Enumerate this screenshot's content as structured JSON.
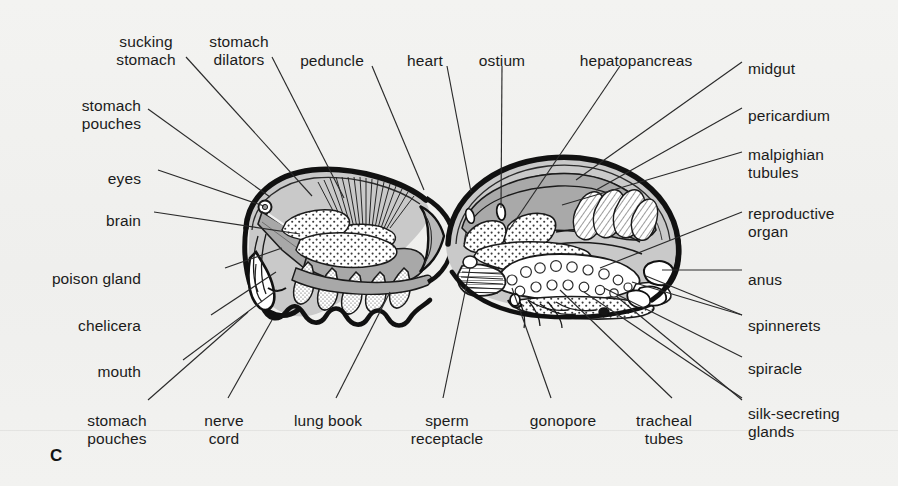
{
  "figure": {
    "letter": "C",
    "caption_type": "anatomical-cross-section",
    "background_color": "#f1f1ef",
    "ink_color": "#1b1b1b"
  },
  "labels_top": [
    {
      "name": "sucking-stomach",
      "text": "sucking\nstomach",
      "x": 146,
      "y": 33,
      "align": "center"
    },
    {
      "name": "stomach-dilators",
      "text": "stomach\ndilators",
      "x": 239,
      "y": 33,
      "align": "center"
    },
    {
      "name": "peduncle",
      "text": "peduncle",
      "x": 332,
      "y": 52,
      "align": "center"
    },
    {
      "name": "heart",
      "text": "heart",
      "x": 425,
      "y": 52,
      "align": "center"
    },
    {
      "name": "ostium",
      "text": "ostium",
      "x": 502,
      "y": 52,
      "align": "center"
    },
    {
      "name": "hepatopancreas",
      "text": "hepatopancreas",
      "x": 636,
      "y": 52,
      "align": "center"
    }
  ],
  "labels_left": [
    {
      "name": "stomach-pouches-upper",
      "text": "stomach\npouches",
      "x": 141,
      "y": 97,
      "align": "right"
    },
    {
      "name": "eyes",
      "text": "eyes",
      "x": 141,
      "y": 170,
      "align": "right"
    },
    {
      "name": "brain",
      "text": "brain",
      "x": 141,
      "y": 212,
      "align": "right"
    },
    {
      "name": "poison-gland",
      "text": "poison gland",
      "x": 141,
      "y": 270,
      "align": "right"
    },
    {
      "name": "chelicera",
      "text": "chelicera",
      "x": 141,
      "y": 317,
      "align": "right"
    },
    {
      "name": "mouth",
      "text": "mouth",
      "x": 141,
      "y": 363,
      "align": "right"
    }
  ],
  "labels_right": [
    {
      "name": "midgut",
      "text": "midgut",
      "x": 748,
      "y": 60,
      "align": "left"
    },
    {
      "name": "pericardium",
      "text": "pericardium",
      "x": 748,
      "y": 107,
      "align": "left"
    },
    {
      "name": "malpighian-tubules",
      "text": "malpighian\ntubules",
      "x": 748,
      "y": 146,
      "align": "left"
    },
    {
      "name": "reproductive-organ",
      "text": "reproductive\norgan",
      "x": 748,
      "y": 205,
      "align": "left"
    },
    {
      "name": "anus",
      "text": "anus",
      "x": 748,
      "y": 271,
      "align": "left"
    },
    {
      "name": "spinnerets",
      "text": "spinnerets",
      "x": 748,
      "y": 317,
      "align": "left"
    },
    {
      "name": "spiracle",
      "text": "spiracle",
      "x": 748,
      "y": 360,
      "align": "left"
    },
    {
      "name": "silk-secreting-glands",
      "text": "silk-secreting\nglands",
      "x": 748,
      "y": 405,
      "align": "left"
    }
  ],
  "labels_bottom": [
    {
      "name": "stomach-pouches-lower",
      "text": "stomach\npouches",
      "x": 117,
      "y": 412,
      "align": "center"
    },
    {
      "name": "nerve-cord",
      "text": "nerve\ncord",
      "x": 224,
      "y": 412,
      "align": "center"
    },
    {
      "name": "lung-book",
      "text": "lung book",
      "x": 328,
      "y": 412,
      "align": "center"
    },
    {
      "name": "sperm-receptacle",
      "text": "sperm\nreceptacle",
      "x": 447,
      "y": 412,
      "align": "center"
    },
    {
      "name": "gonopore",
      "text": "gonopore",
      "x": 563,
      "y": 412,
      "align": "center"
    },
    {
      "name": "tracheal-tubes",
      "text": "tracheal\ntubes",
      "x": 664,
      "y": 412,
      "align": "center"
    }
  ],
  "leader_lines": [
    {
      "name": "leader-sucking-stomach",
      "points": "186,57 312,196"
    },
    {
      "name": "leader-stomach-dilators",
      "points": "272,57 344,198"
    },
    {
      "name": "leader-peduncle",
      "points": "372,66 424,190"
    },
    {
      "name": "leader-heart",
      "points": "447,66 471,192"
    },
    {
      "name": "leader-ostium",
      "points": "502,66 501,208"
    },
    {
      "name": "leader-hepatopancreas",
      "points": "620,66 509,230"
    },
    {
      "name": "leader-stomach-pouches-up",
      "points": "148,109 270,197"
    },
    {
      "name": "leader-eyes",
      "points": "158,170 264,206"
    },
    {
      "name": "leader-brain",
      "points": "154,212 300,234"
    },
    {
      "name": "leader-poison-gland",
      "points": "225,268 282,248"
    },
    {
      "name": "leader-chelicera",
      "points": "211,315 276,272"
    },
    {
      "name": "leader-mouth",
      "points": "183,360 277,290"
    },
    {
      "name": "leader-midgut",
      "points": "742,62 576,180"
    },
    {
      "name": "leader-pericardium",
      "points": "742,108 596,190"
    },
    {
      "name": "leader-malpighian",
      "points": "742,152 562,205"
    },
    {
      "name": "leader-reproductive",
      "points": "742,212 600,268"
    },
    {
      "name": "leader-anus",
      "points": "742,270 662,270"
    },
    {
      "name": "leader-spinnerets-1",
      "points": "742,315 646,276"
    },
    {
      "name": "leader-spinnerets-2",
      "points": "742,315 632,282"
    },
    {
      "name": "leader-spiracle",
      "points": "742,357 604,288"
    },
    {
      "name": "leader-silk-glands",
      "points": "742,400 616,296"
    },
    {
      "name": "leader-stomach-pouches-lo",
      "points": "148,400 248,312"
    },
    {
      "name": "leader-nerve-cord",
      "points": "228,398 272,320"
    },
    {
      "name": "leader-lung-book",
      "points": "336,398 390,292"
    },
    {
      "name": "leader-sperm-receptacle",
      "points": "443,398 470,268"
    },
    {
      "name": "leader-gonopore",
      "points": "551,398 512,288"
    },
    {
      "name": "leader-tracheal-tubes",
      "points": "672,398 560,290"
    },
    {
      "name": "leader-silk-lower",
      "points": "742,398 584,292"
    }
  ]
}
